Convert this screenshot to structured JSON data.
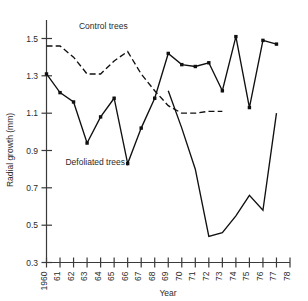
{
  "chart_data": {
    "type": "line",
    "title": "",
    "xlabel": "Year",
    "ylabel": "Radial growth (mm)",
    "xlim": [
      1960,
      1978
    ],
    "ylim": [
      0.3,
      1.6
    ],
    "grid": false,
    "legend_position": "inline-annotation",
    "x": [
      1960,
      1961,
      1962,
      1963,
      1964,
      1965,
      1966,
      1967,
      1968,
      1969,
      1970,
      1971,
      1972,
      1973,
      1974,
      1975,
      1976,
      1977,
      1978
    ],
    "xtick_labels": [
      "1960",
      "61",
      "62",
      "63",
      "64",
      "65",
      "66",
      "67",
      "68",
      "69",
      "70",
      "71",
      "72",
      "73",
      "74",
      "75",
      "76",
      "77",
      "78"
    ],
    "ytick_labels": [
      "0.3",
      "0.5",
      "0.7",
      "0.9",
      "1.1",
      "1.3",
      "1.5"
    ],
    "ytick_values": [
      0.3,
      0.5,
      0.7,
      0.9,
      1.1,
      1.3,
      1.5
    ],
    "series": [
      {
        "name": "Control trees",
        "style": "dashed",
        "markers": false,
        "values": [
          1.46,
          1.46,
          1.4,
          1.31,
          1.31,
          1.38,
          1.43,
          1.31,
          1.22,
          1.14,
          1.1,
          1.1,
          1.11,
          1.11,
          null,
          null,
          null,
          null,
          null
        ]
      },
      {
        "name": "Defoliated trees",
        "style": "solid",
        "markers": true,
        "values": [
          1.31,
          1.21,
          1.16,
          0.94,
          1.08,
          1.18,
          0.83,
          1.02,
          1.18,
          1.42,
          1.36,
          1.35,
          1.37,
          1.22,
          1.51,
          1.13,
          1.49,
          1.47,
          null
        ]
      }
    ],
    "annotations": [
      {
        "text": "Control trees",
        "x": 1964.2,
        "y": 1.55
      },
      {
        "text": "Defoliated trees",
        "x": 1963.6,
        "y": 0.82
      }
    ],
    "second_solid_segment": {
      "name": "Defoliated trees (recovery)",
      "x": [
        1969,
        1970,
        1971,
        1972,
        1973,
        1974,
        1975,
        1976,
        1977
      ],
      "values": [
        1.22,
        1.02,
        0.8,
        0.44,
        0.46,
        0.55,
        0.66,
        0.58,
        1.1
      ]
    },
    "colors": {
      "axis": "#3a3a3a",
      "line": "#101010",
      "text": "#2b2b2b",
      "background": "#ffffff"
    }
  }
}
